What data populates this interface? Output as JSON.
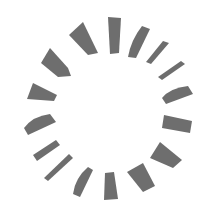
{
  "graphic": {
    "type": "loading-spinner",
    "color": "#6e6e6e",
    "background": "#ffffff",
    "segment_count": 16
  }
}
